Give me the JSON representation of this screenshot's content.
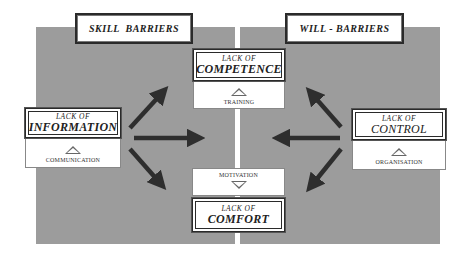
{
  "colors": {
    "panel": "#9c9c9c",
    "arrow": "#2e2e2e",
    "border": "#2a2a2a"
  },
  "headers": {
    "skill": "SKILL  BARRIERS",
    "will": "WILL - BARRIERS"
  },
  "nodes": {
    "competence": {
      "line1": "LACK OF",
      "line2": "COMPETENCE",
      "remedy": "TRAINING",
      "indicator": "triangle-up"
    },
    "information": {
      "line1": "LACK OF",
      "line2": "INFORMATION",
      "remedy": "COMMUNICATION",
      "indicator": "triangle-up"
    },
    "control": {
      "line1": "LACK OF",
      "line2": "CONTROL",
      "remedy": "ORGANISATION",
      "indicator": "triangle-up"
    },
    "comfort": {
      "line1": "LACK OF",
      "line2": "COMFORT",
      "remedy": "MOTIVATION",
      "indicator": "triangle-down"
    }
  },
  "arrows": [
    {
      "from": "information",
      "direction": "up-right"
    },
    {
      "from": "information",
      "direction": "right"
    },
    {
      "from": "information",
      "direction": "down-right"
    },
    {
      "from": "control",
      "direction": "up-left"
    },
    {
      "from": "control",
      "direction": "left"
    },
    {
      "from": "control",
      "direction": "down-left"
    }
  ]
}
